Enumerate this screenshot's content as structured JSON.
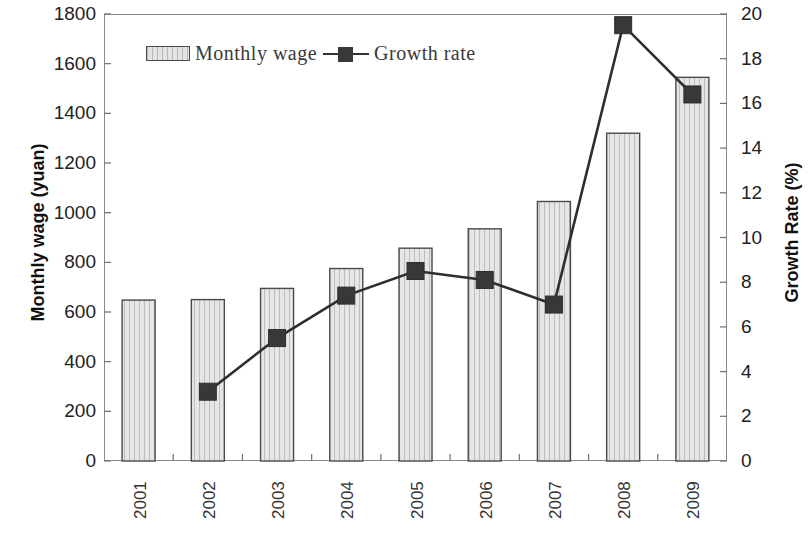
{
  "chart_data": {
    "type": "bar",
    "title": "",
    "xlabel": "",
    "ylabel": "Monthly wage (yuan)",
    "y2label": "Growth Rate (%)",
    "categories": [
      "2001",
      "2002",
      "2003",
      "2004",
      "2005",
      "2006",
      "2007",
      "2008",
      "2009"
    ],
    "ylim": [
      0,
      1800
    ],
    "y2lim": [
      0,
      20
    ],
    "yticks": [
      0,
      200,
      400,
      600,
      800,
      1000,
      1200,
      1400,
      1600,
      1800
    ],
    "y2ticks": [
      0,
      2,
      4,
      6,
      8,
      10,
      12,
      14,
      16,
      18,
      20
    ],
    "grid": false,
    "legend_position": "top-left-inside",
    "series": [
      {
        "name": "Monthly wage",
        "type": "bar",
        "axis": "left",
        "unit": "yuan",
        "color": "#e3e3e3",
        "edge_color": "#4a4a4a",
        "values": [
          648,
          650,
          695,
          775,
          857,
          935,
          1045,
          1320,
          1545
        ]
      },
      {
        "name": "Growth rate",
        "type": "line",
        "axis": "right",
        "unit": "%",
        "color": "#333333",
        "marker": "square",
        "values": [
          null,
          3.1,
          5.5,
          7.4,
          8.5,
          8.1,
          7.0,
          19.5,
          16.4
        ]
      }
    ]
  },
  "legend": {
    "items": [
      {
        "label": "Monthly wage",
        "swatch": "hatched-bar-swatch"
      },
      {
        "label": "Growth rate",
        "swatch": "line-marker-swatch"
      }
    ]
  },
  "axes": {
    "left_title": "Monthly wage (yuan)",
    "right_title": "Growth Rate (%)",
    "left_ticks": [
      "1800",
      "1600",
      "1400",
      "1200",
      "1000",
      "800",
      "600",
      "400",
      "200",
      "0"
    ],
    "right_ticks": [
      "20",
      "18",
      "16",
      "14",
      "12",
      "10",
      "8",
      "6",
      "4",
      "2",
      "0"
    ],
    "x_ticks": [
      "2001",
      "2002",
      "2003",
      "2004",
      "2005",
      "2006",
      "2007",
      "2008",
      "2009"
    ]
  }
}
